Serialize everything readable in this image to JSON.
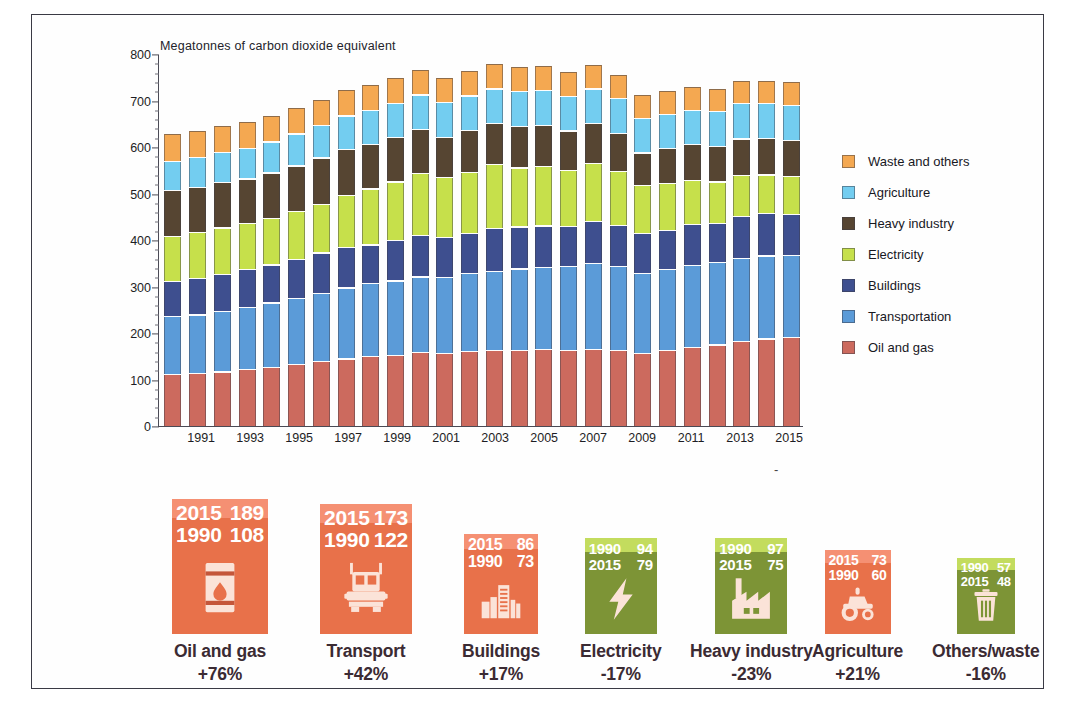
{
  "chart_data": {
    "type": "bar",
    "subtype": "stacked-bar",
    "title": "Megatonnes of carbon dioxide equivalent",
    "xlabel": "",
    "ylabel": "Megatonnes of carbon dioxide equivalent",
    "ylim": [
      0,
      800
    ],
    "yticks": [
      0,
      100,
      200,
      300,
      400,
      500,
      600,
      700,
      800
    ],
    "ytick_labels": [
      "0",
      "100",
      "200",
      "300",
      "400",
      "500",
      "600",
      "700",
      "800"
    ],
    "grid": false,
    "legend_position": "right",
    "x": [
      1990,
      1991,
      1992,
      1993,
      1994,
      1995,
      1996,
      1997,
      1998,
      1999,
      2000,
      2001,
      2002,
      2003,
      2004,
      2005,
      2006,
      2007,
      2008,
      2009,
      2010,
      2011,
      2012,
      2013,
      2014,
      2015
    ],
    "categories": [
      "1990",
      "1991",
      "1992",
      "1993",
      "1994",
      "1995",
      "1996",
      "1997",
      "1998",
      "1999",
      "2000",
      "2001",
      "2002",
      "2003",
      "2004",
      "2005",
      "2006",
      "2007",
      "2008",
      "2009",
      "2010",
      "2011",
      "2012",
      "2013",
      "2014",
      "2015"
    ],
    "xtick_labels": [
      "1991",
      "1993",
      "1995",
      "1997",
      "1999",
      "2001",
      "2003",
      "2005",
      "2007",
      "2009",
      "2011",
      "2013",
      "2015"
    ],
    "series": [
      {
        "name": "Oil and gas",
        "color": "#cc6a5e",
        "values": [
          108,
          110,
          114,
          120,
          124,
          130,
          136,
          142,
          148,
          150,
          156,
          154,
          158,
          160,
          161,
          162,
          161,
          163,
          160,
          154,
          160,
          166,
          172,
          179,
          185,
          189
        ]
      },
      {
        "name": "Transportation",
        "color": "#5b9bd8",
        "values": [
          122,
          124,
          128,
          131,
          136,
          140,
          144,
          150,
          153,
          157,
          160,
          160,
          165,
          168,
          172,
          174,
          178,
          182,
          178,
          170,
          172,
          174,
          175,
          177,
          176,
          173
        ]
      },
      {
        "name": "Buildings",
        "color": "#3e4f8f",
        "values": [
          73,
          76,
          76,
          79,
          79,
          81,
          85,
          84,
          81,
          84,
          86,
          84,
          84,
          90,
          88,
          87,
          83,
          88,
          86,
          83,
          81,
          86,
          81,
          87,
          89,
          86
        ]
      },
      {
        "name": "Electricity",
        "color": "#c6e04b",
        "values": [
          94,
          96,
          98,
          96,
          98,
          100,
          102,
          110,
          118,
          124,
          131,
          126,
          129,
          134,
          124,
          126,
          117,
          121,
          114,
          100,
          99,
          92,
          87,
          86,
          80,
          79
        ]
      },
      {
        "name": "Heavy industry",
        "color": "#564532",
        "values": [
          97,
          95,
          96,
          93,
          95,
          96,
          97,
          97,
          94,
          93,
          92,
          85,
          87,
          86,
          87,
          85,
          83,
          84,
          79,
          68,
          73,
          75,
          74,
          76,
          76,
          75
        ]
      },
      {
        "name": "Agriculture",
        "color": "#73cdf0",
        "values": [
          60,
          61,
          62,
          63,
          64,
          66,
          68,
          69,
          70,
          71,
          72,
          72,
          72,
          72,
          73,
          73,
          72,
          72,
          72,
          71,
          70,
          71,
          72,
          73,
          73,
          73
        ]
      },
      {
        "name": "Waste and others",
        "color": "#f4a851",
        "values": [
          57,
          56,
          56,
          55,
          55,
          55,
          54,
          54,
          53,
          53,
          53,
          52,
          52,
          52,
          52,
          52,
          51,
          51,
          50,
          49,
          49,
          49,
          48,
          48,
          48,
          48
        ]
      }
    ],
    "totals": [
      611,
      618,
      630,
      637,
      651,
      668,
      686,
      706,
      717,
      732,
      750,
      733,
      747,
      762,
      757,
      759,
      745,
      761,
      739,
      695,
      704,
      713,
      709,
      726,
      727,
      723
    ]
  },
  "legend": {
    "items": [
      {
        "label": "Waste and others",
        "color": "#f4a851"
      },
      {
        "label": "Agriculture",
        "color": "#73cdf0"
      },
      {
        "label": "Heavy industry",
        "color": "#564532"
      },
      {
        "label": "Electricity",
        "color": "#c6e04b"
      },
      {
        "label": "Buildings",
        "color": "#3e4f8f"
      },
      {
        "label": "Transportation",
        "color": "#5b9bd8"
      },
      {
        "label": "Oil and gas",
        "color": "#cc6a5e"
      }
    ]
  },
  "cards": [
    {
      "name": "Oil and gas",
      "change": "+76%",
      "tile_color": "#e8714a",
      "accent_color": "#f59073",
      "icon": "oil-barrel-icon",
      "rows": [
        {
          "year": "2015",
          "value": "189"
        },
        {
          "year": "1990",
          "value": "108"
        }
      ]
    },
    {
      "name": "Transport",
      "change": "+42%",
      "tile_color": "#e8714a",
      "accent_color": "#f59073",
      "icon": "truck-icon",
      "rows": [
        {
          "year": "2015",
          "value": "173"
        },
        {
          "year": "1990",
          "value": "122"
        }
      ]
    },
    {
      "name": "Buildings",
      "change": "+17%",
      "tile_color": "#e8714a",
      "accent_color": "#f59073",
      "icon": "buildings-icon",
      "rows": [
        {
          "year": "2015",
          "value": "86"
        },
        {
          "year": "1990",
          "value": "73"
        }
      ]
    },
    {
      "name": "Electricity",
      "change": "-17%",
      "tile_color": "#7d9436",
      "accent_color": "#c3dc5e",
      "icon": "lightning-bolt-icon",
      "rows": [
        {
          "year": "1990",
          "value": "94"
        },
        {
          "year": "2015",
          "value": "79"
        }
      ]
    },
    {
      "name": "Heavy industry",
      "change": "-23%",
      "tile_color": "#7d9436",
      "accent_color": "#c3dc5e",
      "icon": "factory-icon",
      "rows": [
        {
          "year": "1990",
          "value": "97"
        },
        {
          "year": "2015",
          "value": "75"
        }
      ]
    },
    {
      "name": "Agriculture",
      "change": "+21%",
      "tile_color": "#e8714a",
      "accent_color": "#f59073",
      "icon": "tractor-icon",
      "rows": [
        {
          "year": "2015",
          "value": "73"
        },
        {
          "year": "1990",
          "value": "60"
        }
      ]
    },
    {
      "name": "Others/waste",
      "change": "-16%",
      "tile_color": "#7d9436",
      "accent_color": "#c3dc5e",
      "icon": "trash-bin-icon",
      "rows": [
        {
          "year": "1990",
          "value": "57"
        },
        {
          "year": "2015",
          "value": "48"
        }
      ]
    }
  ],
  "misc": {
    "stray_mark": "-"
  }
}
